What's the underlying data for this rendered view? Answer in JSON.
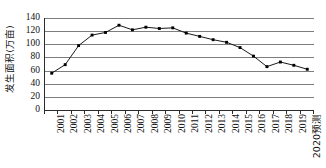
{
  "chart_data": {
    "type": "line",
    "title": "",
    "xlabel": "",
    "ylabel": "发生面积(万亩)",
    "ylim": [
      0,
      140
    ],
    "yticks": [
      0,
      20,
      40,
      60,
      80,
      100,
      120,
      140
    ],
    "ytick_labels": [
      "0",
      "20",
      "40",
      "60",
      "80",
      "100",
      "120",
      "140"
    ],
    "grid": "horizontal",
    "legend": "none",
    "marker": "filled-square",
    "line_color": "#1a1a1a",
    "marker_color": "#000000",
    "grid_color": "#7d7d7d",
    "axis_color": "#2b2b2b",
    "categories": [
      "2001",
      "2002",
      "2003",
      "2004",
      "2005",
      "2006",
      "2007",
      "2008",
      "2009",
      "2010",
      "2011",
      "2012",
      "2013",
      "2014",
      "2015",
      "2016",
      "2017",
      "2018",
      "2019",
      "2020预测"
    ],
    "values": [
      56,
      69,
      98,
      114,
      118,
      129,
      122,
      126,
      124,
      125,
      117,
      112,
      107,
      103,
      95,
      82,
      66,
      73,
      68,
      62
    ],
    "series": [
      {
        "name": "发生面积",
        "values": [
          56,
          69,
          98,
          114,
          118,
          129,
          122,
          126,
          124,
          125,
          117,
          112,
          107,
          103,
          95,
          82,
          66,
          73,
          68,
          62
        ]
      }
    ]
  }
}
